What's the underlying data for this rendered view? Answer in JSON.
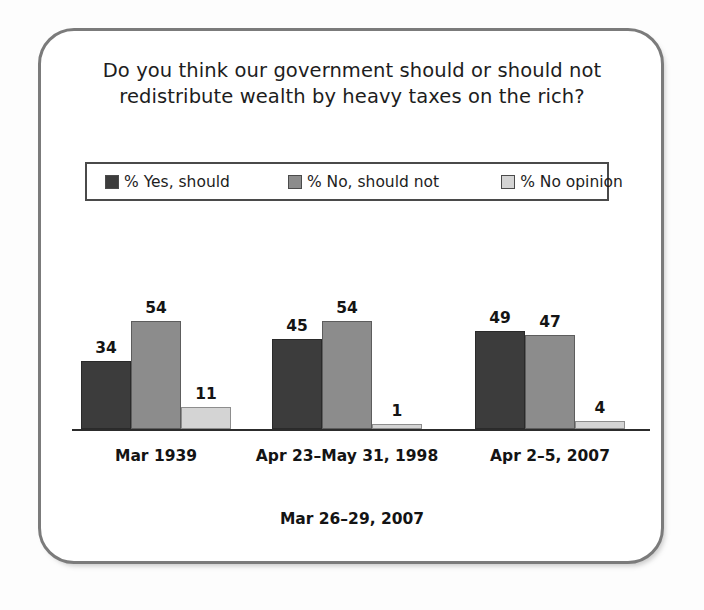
{
  "figure": {
    "title_line_1": "Do you think our government should or should not",
    "title_line_2": "redistribute wealth by heavy taxes on the rich?",
    "footer_note": "Mar 26–29, 2007"
  },
  "legend": {
    "items": [
      {
        "label": "% Yes, should",
        "color": "#3c3c3c",
        "swatch_name": "legend-swatch-yes"
      },
      {
        "label": "% No, should not",
        "color": "#8c8c8c",
        "swatch_name": "legend-swatch-no"
      },
      {
        "label": "% No opinion",
        "color": "#d4d4d4",
        "swatch_name": "legend-swatch-no-opinion"
      }
    ]
  },
  "chart_data": {
    "type": "bar",
    "title": "Do you think our government should or should not redistribute wealth by heavy taxes on the rich?",
    "xlabel": "",
    "ylabel": "",
    "ylim": [
      0,
      60
    ],
    "grid": false,
    "legend_position": "top",
    "categories": [
      "Mar 1939",
      "Apr 23–May 31, 1998",
      "Apr 2–5, 2007"
    ],
    "series": [
      {
        "name": "% Yes, should",
        "color": "#3c3c3c",
        "values": [
          34,
          45,
          49
        ]
      },
      {
        "name": "% No, should not",
        "color": "#8c8c8c",
        "values": [
          54,
          54,
          47
        ]
      },
      {
        "name": "% No opinion",
        "color": "#d4d4d4",
        "values": [
          11,
          1,
          4
        ]
      }
    ],
    "annotations": [
      "Mar 26–29, 2007"
    ],
    "data_labels": [
      [
        "34",
        "54",
        "11"
      ],
      [
        "45",
        "54",
        "1"
      ],
      [
        "49",
        "47",
        "4"
      ]
    ]
  }
}
